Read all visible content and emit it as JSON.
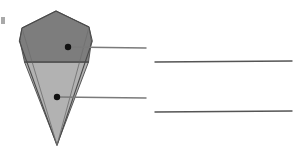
{
  "diagram": {
    "title": "",
    "type": "labeling-diagram",
    "canvas": {
      "width": 306,
      "height": 154,
      "background": "#ffffff"
    },
    "colors": {
      "upper_region_fill": "#7d7d7d",
      "lower_region_fill": "#b2b2b2",
      "outline": "#4a4a4a",
      "inner_edge": "#6f6f6f",
      "callout_dot": "#111111",
      "leader_line": "#7a7a7a",
      "answer_line": "#555555",
      "background": "#ffffff"
    },
    "shape": {
      "name": "inverted-cone",
      "description": "Pentagonal top face narrowing to a point at the bottom",
      "apex_top": {
        "x": 56,
        "y": 11
      },
      "tip_bottom": {
        "x": 57,
        "y": 145
      },
      "outline_points": "56,11 22,28 19,41 57,145 92,41 89,27",
      "upper_region_points": "56,11 22,28 20,40 25,62 88,62 91,41 89,27",
      "lower_region_points": "25,62 88,62 57,145",
      "division_line": {
        "x1": 25,
        "y1": 62,
        "x2": 88,
        "y2": 62
      },
      "back_edge_left": "22,28 57,145",
      "back_edge_right": "89,27 57,145",
      "side_edge_left": "19,41 57,145",
      "side_edge_right": "92,41 57,145"
    },
    "callouts": [
      {
        "id": "callout-upper",
        "region": "upper",
        "dot": {
          "x": 68,
          "y": 47,
          "radius": 3.2
        },
        "leader_line": {
          "x1": 68,
          "y1": 47,
          "x2": 146,
          "y2": 48
        },
        "answer_line": {
          "x1": 155,
          "y1": 62,
          "x2": 292,
          "y2": 61
        },
        "answer_text": ""
      },
      {
        "id": "callout-lower",
        "region": "lower",
        "dot": {
          "x": 57,
          "y": 97,
          "radius": 3.2
        },
        "leader_line": {
          "x1": 57,
          "y1": 97,
          "x2": 146,
          "y2": 98
        },
        "answer_line": {
          "x1": 155,
          "y1": 112,
          "x2": 292,
          "y2": 111
        },
        "answer_text": ""
      }
    ],
    "edge_artifact": {
      "x": 1,
      "y": 17,
      "width": 4,
      "height": 7,
      "color": "#9a9a9a"
    }
  }
}
